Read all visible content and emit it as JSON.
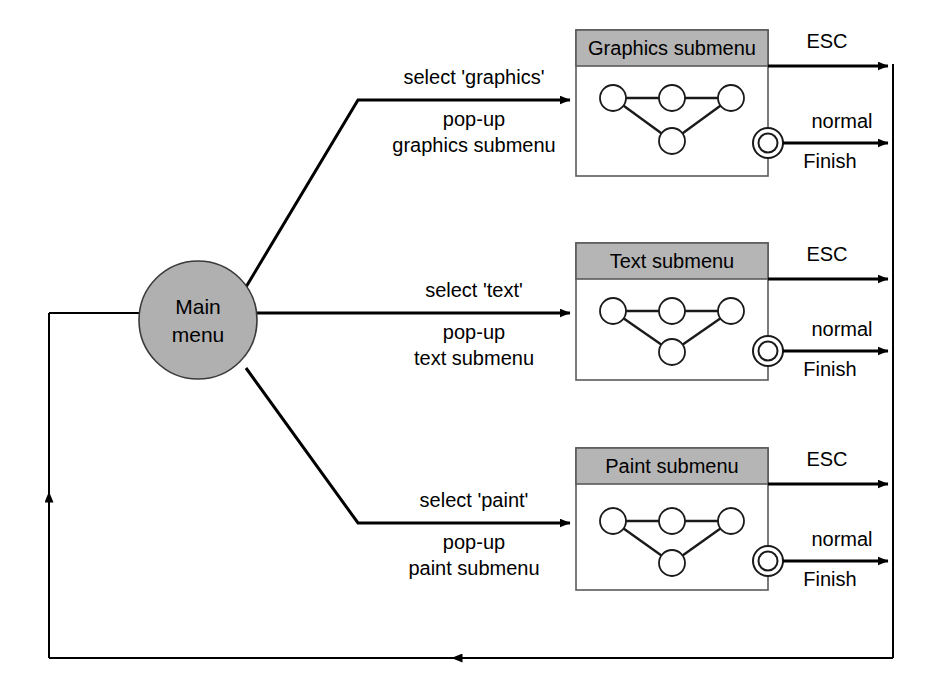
{
  "diagram": {
    "colors": {
      "fill_gray": "#b0b0b0",
      "header_gray": "#b5b5b5",
      "stroke_black": "#000000",
      "background": "#ffffff"
    },
    "main_state": {
      "label_line1": "Main",
      "label_line2": "menu",
      "shape": "circle"
    },
    "branches": [
      {
        "id": "graphics",
        "box_title": "Graphics submenu",
        "trigger_label": "select 'graphics'",
        "action_line1": "pop-up",
        "action_line2": "graphics submenu",
        "exit_esc_label": "ESC",
        "exit_normal_line1": "normal",
        "exit_normal_line2": "Finish",
        "inner_nodes": 4
      },
      {
        "id": "text",
        "box_title": "Text submenu",
        "trigger_label": "select 'text'",
        "action_line1": "pop-up",
        "action_line2": "text submenu",
        "exit_esc_label": "ESC",
        "exit_normal_line1": "normal",
        "exit_normal_line2": "Finish",
        "inner_nodes": 4
      },
      {
        "id": "paint",
        "box_title": "Paint submenu",
        "trigger_label": "select 'paint'",
        "action_line1": "pop-up",
        "action_line2": "paint submenu",
        "exit_esc_label": "ESC",
        "exit_normal_line1": "normal",
        "exit_normal_line2": "Finish",
        "inner_nodes": 4
      }
    ],
    "return_path": {
      "description": "return to main menu"
    }
  }
}
